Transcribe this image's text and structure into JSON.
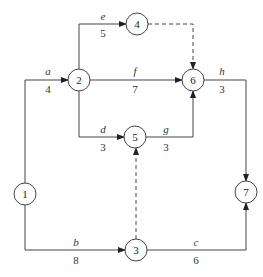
{
  "diagram": {
    "type": "activity-on-arrow network",
    "nodes": [
      {
        "id": "1",
        "label": "1",
        "x": 25,
        "y": 194
      },
      {
        "id": "2",
        "label": "2",
        "x": 79,
        "y": 80
      },
      {
        "id": "3",
        "label": "3",
        "x": 136,
        "y": 250
      },
      {
        "id": "4",
        "label": "4",
        "x": 137,
        "y": 24
      },
      {
        "id": "5",
        "label": "5",
        "x": 135,
        "y": 137
      },
      {
        "id": "6",
        "label": "6",
        "x": 193,
        "y": 80
      },
      {
        "id": "7",
        "label": "7",
        "x": 246,
        "y": 192
      }
    ],
    "activities": [
      {
        "name": "a",
        "duration": "4",
        "from": "1",
        "to": "2"
      },
      {
        "name": "b",
        "duration": "8",
        "from": "1",
        "to": "3"
      },
      {
        "name": "c",
        "duration": "6",
        "from": "3",
        "to": "7"
      },
      {
        "name": "d",
        "duration": "3",
        "from": "2",
        "to": "5"
      },
      {
        "name": "e",
        "duration": "5",
        "from": "2",
        "to": "4"
      },
      {
        "name": "f",
        "duration": "7",
        "from": "2",
        "to": "6"
      },
      {
        "name": "g",
        "duration": "3",
        "from": "5",
        "to": "6"
      },
      {
        "name": "h",
        "duration": "3",
        "from": "6",
        "to": "7"
      }
    ],
    "dummies": [
      {
        "from": "4",
        "to": "6"
      },
      {
        "from": "3",
        "to": "5"
      }
    ]
  }
}
